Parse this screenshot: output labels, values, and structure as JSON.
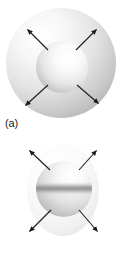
{
  "figure": {
    "background_color": "#ffffff",
    "panels": [
      {
        "id": "a",
        "label": "(a)",
        "caption_label": "(a)",
        "description": "isotropic-spherical-expansion",
        "shapes": {
          "outer_sphere": {
            "name": "outer-sphere",
            "cx": 61,
            "cy": 63,
            "r": 55,
            "fill_light": "#fdfdfd",
            "fill_mid": "#e3e3e3",
            "fill_dark": "#b4b4b4",
            "highlight_x": 44,
            "highlight_y": 36
          },
          "inner_sphere": {
            "name": "inner-sphere",
            "cx": 62,
            "cy": 67,
            "r": 26,
            "fill_light": "#ffffff",
            "fill_mid": "#e8e8e8",
            "fill_dark": "#b0b0b0",
            "highlight_x": 70,
            "highlight_y": 56
          }
        },
        "arrows": [
          {
            "name": "arrow-upper-left",
            "x1": 48,
            "y1": 50,
            "x2": 26,
            "y2": 28
          },
          {
            "name": "arrow-upper-right",
            "x1": 76,
            "y1": 50,
            "x2": 98,
            "y2": 28
          },
          {
            "name": "arrow-lower-left",
            "x1": 48,
            "y1": 85,
            "x2": 24,
            "y2": 107
          },
          {
            "name": "arrow-lower-right",
            "x1": 77,
            "y1": 85,
            "x2": 100,
            "y2": 105
          }
        ]
      },
      {
        "id": "b",
        "label": "(b)",
        "caption_label": "(b)",
        "description": "anisotropic-quadrupolar-expansion",
        "shapes": {
          "outer_lobe": {
            "name": "outer-lobe-prolate",
            "cx": 63,
            "cy": 58,
            "rx": 36,
            "ry": 46,
            "fill_light": "#ffffff",
            "fill_mid": "#f2f2f2",
            "fill_dark": "#dedede"
          },
          "core_sphere": {
            "name": "core-sphere",
            "cx": 64,
            "cy": 57,
            "r": 28,
            "fill_light": "#ffffff",
            "fill_mid": "#e6e6e6",
            "fill_dark": "#a9a9a9",
            "highlight_x": 72,
            "highlight_y": 44
          },
          "equator_band": {
            "name": "equator-band",
            "cy": 57,
            "height": 9,
            "color": "#9a9a9a"
          }
        },
        "arrows": [
          {
            "name": "arrow-upper-left",
            "x1": 49,
            "y1": 38,
            "x2": 28,
            "y2": 17
          },
          {
            "name": "arrow-upper-right",
            "x1": 79,
            "y1": 38,
            "x2": 98,
            "y2": 17
          },
          {
            "name": "arrow-lower-left",
            "x1": 50,
            "y1": 78,
            "x2": 28,
            "y2": 101
          },
          {
            "name": "arrow-lower-right",
            "x1": 79,
            "y1": 78,
            "x2": 99,
            "y2": 101
          }
        ]
      }
    ],
    "arrow_color": "#1c1c1c",
    "arrow_stroke_width": 1.1,
    "arrow_head_size": 4
  }
}
